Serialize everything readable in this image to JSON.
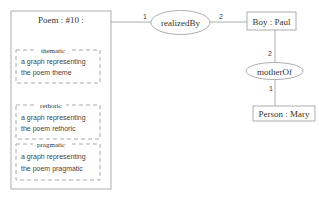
{
  "diagram": {
    "type": "conceptual-graph",
    "colors": {
      "line": "#999999",
      "box_border": "#999999",
      "dash_border": "#888888",
      "text": "#333333",
      "background": "#ffffff"
    },
    "poem": {
      "title": "Poem : #10 :",
      "sections": [
        {
          "title": "thematic",
          "line1": "a graph representing",
          "line2": "the poem theme"
        },
        {
          "title": "rethoric",
          "line1": "a graph representing",
          "line2": "the poem rethoric"
        },
        {
          "title": "pragmatic",
          "line1": "a graph representing",
          "line2": "the poem pragmatic"
        }
      ]
    },
    "relations": [
      {
        "label": "realizedBy",
        "arc_in": "1",
        "arc_out": "2"
      },
      {
        "label": "motherOf",
        "arc_in": "2",
        "arc_out": "1"
      }
    ],
    "concepts": [
      {
        "label": "Boy : Paul"
      },
      {
        "label": "Person : Mary"
      }
    ]
  }
}
